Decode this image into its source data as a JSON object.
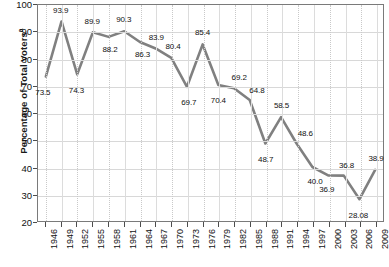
{
  "chart_data": {
    "type": "line",
    "title": "",
    "xlabel": "",
    "ylabel": "Percentage of Total Voters",
    "ylabel_superscript": "a",
    "ylim": [
      20,
      100
    ],
    "yticks": [
      20,
      30,
      40,
      50,
      60,
      70,
      80,
      90,
      100
    ],
    "grid": true,
    "legend": "none",
    "line_color": "#808080",
    "categories": [
      "1946",
      "1949",
      "1952",
      "1955",
      "1958",
      "1961",
      "1964",
      "1967",
      "1970",
      "1973",
      "1976",
      "1979",
      "1982",
      "1985",
      "1988",
      "1991",
      "1994",
      "1997",
      "2000",
      "2003",
      "2006",
      "2009"
    ],
    "values": [
      73.5,
      93.9,
      74.3,
      89.9,
      88.2,
      90.3,
      86.3,
      83.9,
      80.4,
      69.7,
      85.4,
      70.4,
      69.2,
      64.8,
      48.7,
      58.5,
      48.6,
      40.0,
      36.9,
      36.8,
      28.08,
      38.9
    ],
    "point_labels": [
      "73.5",
      "93.9",
      "74.3",
      "89.9",
      "88.2",
      "90.3",
      "86.3",
      "83.9",
      "80.4",
      "69.7",
      "85.4",
      "70.4",
      "69.2",
      "64.8",
      "48.7",
      "58.5",
      "48.6",
      "40.0",
      "36.9",
      "36.8",
      "28.08",
      "38.9"
    ]
  }
}
